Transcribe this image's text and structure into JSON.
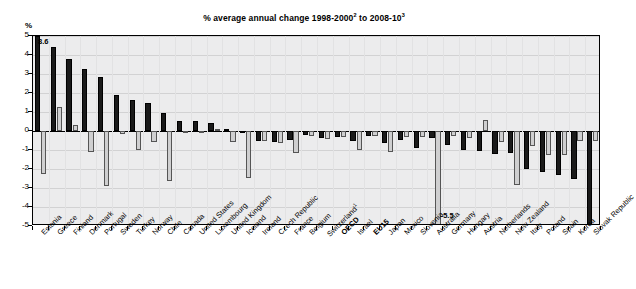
{
  "chart_data": {
    "type": "bar",
    "title_parts": {
      "lead": "% average annual change 1998-2000",
      "sup1": "2",
      "mid": " to 2008-10",
      "sup2": "3"
    },
    "ylabel": "%",
    "xlabel": "",
    "ylim": [
      -5,
      5
    ],
    "yticks": [
      5,
      4,
      3,
      2,
      1,
      0,
      -1,
      -2,
      -3,
      -4,
      -5
    ],
    "ytick_labels": [
      "5",
      "4",
      "3",
      "2",
      "1",
      "0",
      "-1",
      "-2",
      "-3",
      "-4",
      "-5"
    ],
    "grid": true,
    "legend_position": "none",
    "categories": [
      "Estonia",
      "Greece",
      "Finland",
      "Denmark",
      "Portugal",
      "Sweden",
      "Turkey",
      "Norway",
      "Chile",
      "Canada",
      "United States",
      "Luxembourg",
      "United Kingdom",
      "Iceland",
      "Ireland",
      "Czech Republic",
      "France",
      "Belgium",
      "Switzerland",
      "OECD",
      "Israel",
      "EU15",
      "Japan",
      "Mexico",
      "Slovenia",
      "Australia",
      "Germany",
      "Hungary",
      "Austria",
      "Netherlands",
      "New Zealand",
      "Italy",
      "Poland",
      "Spain",
      "Korea",
      "Slovak Republic"
    ],
    "category_styles": {
      "OECD": "bold",
      "EU15": "bold",
      "Switzerland": "superscript-1"
    },
    "series": [
      {
        "name": "series-1",
        "values": [
          5.0,
          4.4,
          3.8,
          3.25,
          2.85,
          1.9,
          1.65,
          1.48,
          0.97,
          0.55,
          0.52,
          0.4,
          0.12,
          -0.05,
          -0.55,
          -0.6,
          -0.45,
          -0.2,
          -0.35,
          -0.3,
          -0.55,
          -0.25,
          -0.65,
          -0.45,
          -0.9,
          -0.35,
          -0.75,
          -1.0,
          -1.05,
          -1.2,
          -1.15,
          -2.0,
          -2.15,
          -2.3,
          -2.55,
          -4.95
        ]
      },
      {
        "name": "series-2",
        "values": [
          -2.25,
          1.28,
          0.32,
          -1.1,
          -2.9,
          -0.15,
          -1.0,
          -0.6,
          -2.65,
          -0.05,
          -0.05,
          0.1,
          -0.6,
          -2.45,
          -0.55,
          -0.65,
          -1.15,
          -0.25,
          -0.4,
          -0.3,
          -1.0,
          -0.25,
          -1.1,
          -0.3,
          -0.3,
          -5.5,
          -0.25,
          -0.35,
          0.58,
          -0.6,
          -2.85,
          -0.8,
          -1.25,
          -1.25,
          -0.55,
          -0.55
        ]
      }
    ],
    "annotations": [
      {
        "label": "8.6",
        "category": "Estonia",
        "series": "series-1",
        "note": "clipped above axis maximum"
      },
      {
        "label": "-5.5",
        "category": "Australia",
        "series": "series-2",
        "note": "clipped below axis minimum"
      }
    ],
    "colors": {
      "series_1": "#1a1a1a",
      "series_2": "#cfcfd0",
      "plot_background": "#ececed",
      "axis": "#000000",
      "gridline": "#d2d2d3"
    }
  }
}
